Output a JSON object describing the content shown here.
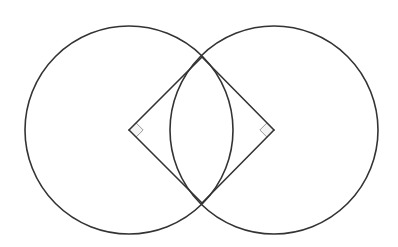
{
  "diagram": {
    "type": "geometry",
    "canvas": {
      "width": 398,
      "height": 247,
      "background": "#ffffff"
    },
    "colors": {
      "stroke": "#333333",
      "marker_stroke": "#999999",
      "marker_fill": "#f4f4f4"
    },
    "circles": [
      {
        "id": "left-circle",
        "cx": 129,
        "cy": 130,
        "r": 104
      },
      {
        "id": "right-circle",
        "cx": 274,
        "cy": 130,
        "r": 104
      }
    ],
    "points": {
      "left_center": {
        "x": 129,
        "y": 130
      },
      "right_center": {
        "x": 274,
        "y": 130
      },
      "top_intersection": {
        "x": 202,
        "y": 57
      },
      "bottom_intersection": {
        "x": 202,
        "y": 203
      }
    },
    "segments": [
      {
        "id": "left-to-top",
        "from": "left_center",
        "to": "top_intersection"
      },
      {
        "id": "left-to-bottom",
        "from": "left_center",
        "to": "bottom_intersection"
      },
      {
        "id": "right-to-top",
        "from": "right_center",
        "to": "top_intersection"
      },
      {
        "id": "right-to-bottom",
        "from": "right_center",
        "to": "bottom_intersection"
      }
    ],
    "right_angle_markers": [
      {
        "id": "left-right-angle",
        "at": "left_center",
        "size": 10,
        "direction": 1
      },
      {
        "id": "right-right-angle",
        "at": "right_center",
        "size": 10,
        "direction": -1
      }
    ]
  }
}
